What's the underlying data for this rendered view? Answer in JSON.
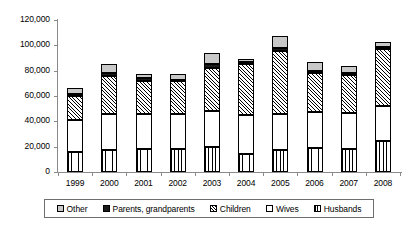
{
  "chart_data": {
    "type": "bar",
    "stacked": true,
    "title": "",
    "subtitle": "",
    "xlabel": "",
    "ylabel": "",
    "categories": [
      "1999",
      "2000",
      "2001",
      "2002",
      "2003",
      "2004",
      "2005",
      "2006",
      "2007",
      "2008"
    ],
    "ylim": [
      0,
      120000
    ],
    "ytick_labels": [
      "0",
      "20,000",
      "40,000",
      "60,000",
      "80,000",
      "100,000",
      "120,000"
    ],
    "ytick_values": [
      0,
      20000,
      40000,
      60000,
      80000,
      100000,
      120000
    ],
    "grid": false,
    "legend_position": "bottom",
    "series": [
      {
        "name": "Husbands",
        "pattern": "vertical-hatch",
        "values": [
          16000,
          17500,
          18500,
          18500,
          20000,
          14000,
          17000,
          19000,
          18500,
          24500
        ]
      },
      {
        "name": "Wives",
        "pattern": "solid-white",
        "values": [
          25000,
          28500,
          27000,
          27500,
          28000,
          31000,
          28500,
          28000,
          28000,
          27500
        ]
      },
      {
        "name": "Children",
        "pattern": "diagonal-hatch",
        "values": [
          19000,
          30000,
          26500,
          25500,
          34500,
          40000,
          50000,
          31500,
          30000,
          45500
        ]
      },
      {
        "name": "Parents, grandparents",
        "pattern": "solid-black",
        "values": [
          1500,
          2500,
          2000,
          1500,
          3000,
          1500,
          2500,
          1500,
          1500,
          1500
        ]
      },
      {
        "name": "Other",
        "pattern": "solid-gray",
        "values": [
          4500,
          6500,
          3000,
          4000,
          8500,
          2500,
          9000,
          7000,
          6000,
          4000
        ]
      }
    ],
    "totals": [
      66000,
      85000,
      77000,
      77000,
      94000,
      89000,
      107000,
      87000,
      84000,
      103000
    ]
  },
  "legend": {
    "items": [
      {
        "label": "Other",
        "swatch": "other-swatch-icon"
      },
      {
        "label": "Parents, grandparents",
        "swatch": "parents-swatch-icon"
      },
      {
        "label": "Children",
        "swatch": "children-swatch-icon"
      },
      {
        "label": "Wives",
        "swatch": "wives-swatch-icon"
      },
      {
        "label": "Husbands",
        "swatch": "husbands-swatch-icon"
      }
    ]
  },
  "colors": {
    "other": "#c9c9c9",
    "parents": "#1a1a1a",
    "children": "#ffffff",
    "wives": "#ffffff",
    "husbands": "#ffffff",
    "axis": "#8a8a8a",
    "outline": "#000000",
    "background": "#ffffff"
  }
}
